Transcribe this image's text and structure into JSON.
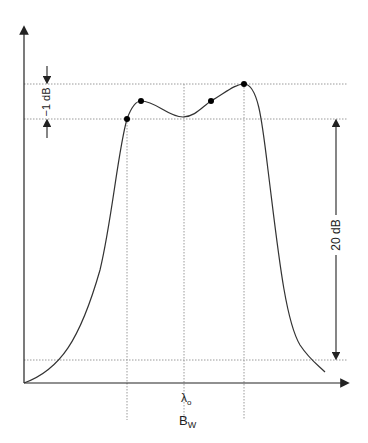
{
  "figure": {
    "type": "filter passband response diagram",
    "labels": {
      "ripple": "−1 dB",
      "attenuation": "20 dB",
      "center_wavelength": "λ",
      "center_wavelength_sub": "o",
      "bandwidth": "B",
      "bandwidth_sub": "W"
    },
    "colors": {
      "line": "#333333",
      "grid": "#9a9a9a",
      "point": "#000000"
    },
    "marked_points": 4
  }
}
